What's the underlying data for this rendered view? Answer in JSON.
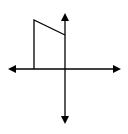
{
  "diagram": {
    "stroke_color": "#000000",
    "background": "#ffffff",
    "axes": {
      "origin": [
        65,
        69
      ],
      "x_axis": {
        "from": [
          8,
          69
        ],
        "to": [
          121,
          69
        ],
        "arrows": "both"
      },
      "y_axis": {
        "from": [
          65,
          13
        ],
        "to": [
          65,
          124
        ],
        "arrows": "both"
      }
    },
    "shape": {
      "type": "polyline",
      "points": [
        [
          34,
          69
        ],
        [
          34,
          20
        ],
        [
          65,
          35
        ]
      ]
    }
  }
}
